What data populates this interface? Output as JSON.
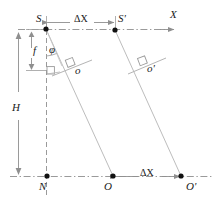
{
  "figure": {
    "type": "geometry-diagram",
    "title": "",
    "colors": {
      "ray": "#b9b9b9",
      "dashed_axis": "#8f8f8f",
      "dimension_arrow": "#8f8f8f",
      "point": "#111111",
      "text": "#1a1a1a",
      "background": "#ffffff"
    },
    "labels": {
      "station_left": "S",
      "station_right": "S'",
      "axis_x": "X",
      "focal_length": "f",
      "tilt_angle": "φ",
      "image_point_left": "o",
      "image_point_right": "o'",
      "height": "H",
      "nadir": "N",
      "ground_left": "O",
      "ground_right": "O'",
      "baseline_top": "ΔX",
      "baseline_bottom": "ΔX"
    },
    "points": [
      {
        "name": "S",
        "x": 46,
        "y": 29
      },
      {
        "name": "S'",
        "x": 115,
        "y": 30
      },
      {
        "name": "N",
        "x": 47,
        "y": 176
      },
      {
        "name": "O",
        "x": 113,
        "y": 176
      },
      {
        "name": "O'",
        "x": 181,
        "y": 176
      }
    ],
    "dimensions": [
      {
        "name": "ΔX",
        "from": "S",
        "to": "S'",
        "placement": "top"
      },
      {
        "name": "ΔX",
        "from": "O",
        "to": "O'",
        "placement": "bottom"
      },
      {
        "name": "f",
        "from": "S",
        "to": "image-plane",
        "placement": "left-inner"
      },
      {
        "name": "H",
        "from": "S",
        "to": "N",
        "placement": "left-outer"
      }
    ]
  }
}
